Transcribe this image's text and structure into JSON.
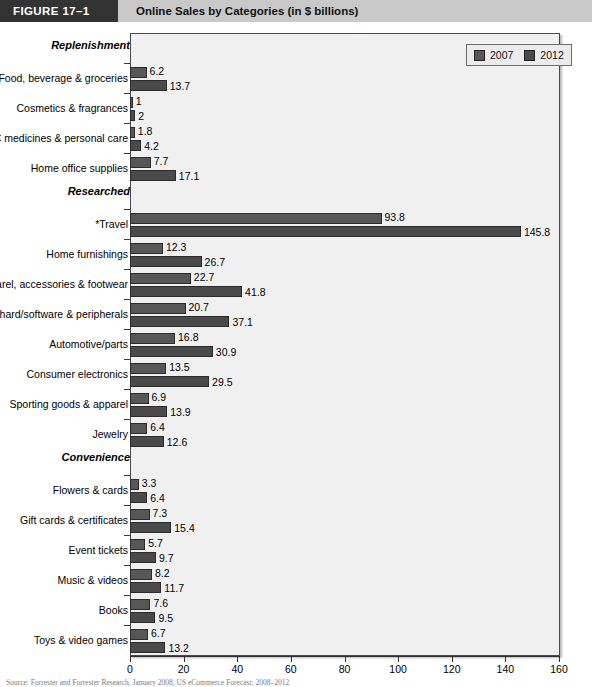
{
  "figure": {
    "tag": "FIGURE  17–1",
    "title": "Online Sales by Categories (in $ billions)"
  },
  "legend": {
    "entries": [
      {
        "label": "2007",
        "color": "#575757"
      },
      {
        "label": "2012",
        "color": "#4a4a4a"
      }
    ]
  },
  "source_note": "Source: Forrester and Forrester Research, January 2008, US eCommerce Forecast: 2008–2012",
  "chart_data": {
    "type": "bar",
    "orientation": "horizontal",
    "title": "Online Sales by Categories (in $ billions)",
    "xlabel": "",
    "ylabel": "",
    "xlim": [
      0,
      160
    ],
    "xticks": [
      0,
      20,
      40,
      60,
      80,
      100,
      120,
      140,
      160
    ],
    "grid": false,
    "legend_position": "top-right",
    "series": [
      {
        "name": "2007",
        "color": "#575757"
      },
      {
        "name": "2012",
        "color": "#4a4a4a"
      }
    ],
    "groups": [
      {
        "name": "Replenishment",
        "categories": [
          {
            "label": "Food, beverage & groceries",
            "v2007": 6.2,
            "v2012": 13.7
          },
          {
            "label": "Cosmetics & fragrances",
            "v2007": 1,
            "v2012": 2
          },
          {
            "label": "OTC medicines & personal care",
            "v2007": 1.8,
            "v2012": 4.2
          },
          {
            "label": "Home office supplies",
            "v2007": 7.7,
            "v2012": 17.1
          }
        ]
      },
      {
        "name": "Researched",
        "categories": [
          {
            "label": "*Travel",
            "v2007": 93.8,
            "v2012": 145.8
          },
          {
            "label": "Home furnishings",
            "v2007": 12.3,
            "v2012": 26.7
          },
          {
            "label": "Apparel, accessories & footwear",
            "v2007": 22.7,
            "v2012": 41.8
          },
          {
            "label": "Computer hard/software & peripherals",
            "v2007": 20.7,
            "v2012": 37.1
          },
          {
            "label": "Automotive/parts",
            "v2007": 16.8,
            "v2012": 30.9
          },
          {
            "label": "Consumer electronics",
            "v2007": 13.5,
            "v2012": 29.5
          },
          {
            "label": "Sporting goods & apparel",
            "v2007": 6.9,
            "v2012": 13.9
          },
          {
            "label": "Jewelry",
            "v2007": 6.4,
            "v2012": 12.6
          }
        ]
      },
      {
        "name": "Convenience",
        "categories": [
          {
            "label": "Flowers & cards",
            "v2007": 3.3,
            "v2012": 6.4
          },
          {
            "label": "Gift cards & certificates",
            "v2007": 7.3,
            "v2012": 15.4
          },
          {
            "label": "Event tickets",
            "v2007": 5.7,
            "v2012": 9.7
          },
          {
            "label": "Music & videos",
            "v2007": 8.2,
            "v2012": 11.7
          },
          {
            "label": "Books",
            "v2007": 7.6,
            "v2012": 9.5
          },
          {
            "label": "Toys & video games",
            "v2007": 6.7,
            "v2012": 13.2
          }
        ]
      }
    ]
  }
}
